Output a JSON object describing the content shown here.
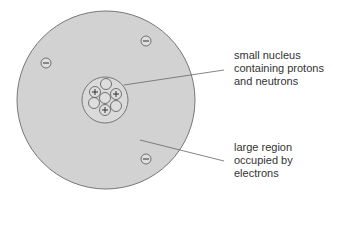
{
  "diagram": {
    "colors": {
      "atom_fill": "#d2d2d2",
      "outline": "#777777",
      "line": "#666666",
      "text": "#333333"
    },
    "labels": [
      {
        "id": "nucleus",
        "lines": [
          "small nucleus",
          "containing protons",
          "and neutrons"
        ]
      },
      {
        "id": "electron-region",
        "lines": [
          "large region",
          "occupied by",
          "electrons"
        ]
      }
    ],
    "electron_symbol": "−",
    "proton_symbol": "+",
    "electron_count": 4,
    "proton_count": 3,
    "neutron_count": 4
  }
}
